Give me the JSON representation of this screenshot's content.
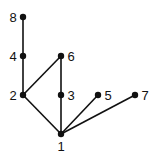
{
  "diagram": {
    "type": "hasse-diagram",
    "colors": {
      "edge": "#111111",
      "node": "#111111",
      "background": "#ffffff"
    },
    "nodes": [
      {
        "id": "1",
        "label": "1",
        "x": 61,
        "y": 134,
        "lx": 61,
        "ly": 151,
        "anchor": "middle"
      },
      {
        "id": "2",
        "label": "2",
        "x": 23,
        "y": 95,
        "lx": 13,
        "ly": 100,
        "anchor": "middle"
      },
      {
        "id": "3",
        "label": "3",
        "x": 61,
        "y": 95,
        "lx": 71,
        "ly": 100,
        "anchor": "middle"
      },
      {
        "id": "4",
        "label": "4",
        "x": 23,
        "y": 56,
        "lx": 13,
        "ly": 61,
        "anchor": "middle"
      },
      {
        "id": "5",
        "label": "5",
        "x": 98,
        "y": 95,
        "lx": 108,
        "ly": 100,
        "anchor": "middle"
      },
      {
        "id": "6",
        "label": "6",
        "x": 61,
        "y": 56,
        "lx": 71,
        "ly": 61,
        "anchor": "middle"
      },
      {
        "id": "7",
        "label": "7",
        "x": 135,
        "y": 95,
        "lx": 145,
        "ly": 100,
        "anchor": "middle"
      },
      {
        "id": "8",
        "label": "8",
        "x": 23,
        "y": 17,
        "lx": 13,
        "ly": 22,
        "anchor": "middle"
      }
    ],
    "edges": [
      {
        "from": "1",
        "to": "2"
      },
      {
        "from": "1",
        "to": "3"
      },
      {
        "from": "1",
        "to": "5"
      },
      {
        "from": "1",
        "to": "7"
      },
      {
        "from": "2",
        "to": "4"
      },
      {
        "from": "2",
        "to": "6"
      },
      {
        "from": "3",
        "to": "6"
      },
      {
        "from": "4",
        "to": "8"
      }
    ]
  }
}
